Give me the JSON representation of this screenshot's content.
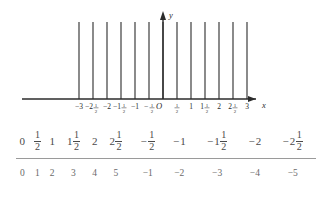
{
  "figure": {
    "name": "impulse-train-plot",
    "axis": {
      "x_label": "x",
      "y_label": "y",
      "origin_label": "O"
    },
    "x_ticks": [
      {
        "label": "-3",
        "value": -3.0
      },
      {
        "label": "-2",
        "value": -2.5,
        "mixed": true,
        "whole": "2",
        "sign": "-",
        "num": "1",
        "den": "2"
      },
      {
        "label": "-2",
        "value": -2.0
      },
      {
        "label": "-1",
        "value": -1.5,
        "mixed": true,
        "whole": "1",
        "sign": "-",
        "num": "1",
        "den": "2"
      },
      {
        "label": "-1",
        "value": -1.0
      },
      {
        "label": "-",
        "value": -0.5,
        "mixed": false,
        "sign": "-",
        "num": "1",
        "den": "2"
      },
      {
        "label": "",
        "value": 0.0
      },
      {
        "label": "",
        "value": 0.5,
        "mixed": false,
        "sign": "",
        "num": "1",
        "den": "2"
      },
      {
        "label": "1",
        "value": 1.0
      },
      {
        "label": "1",
        "value": 1.5,
        "mixed": true,
        "whole": "1",
        "sign": "",
        "num": "1",
        "den": "2"
      },
      {
        "label": "2",
        "value": 2.0
      },
      {
        "label": "2",
        "value": 2.5,
        "mixed": true,
        "whole": "2",
        "sign": "",
        "num": "1",
        "den": "2"
      },
      {
        "label": "3",
        "value": 3.0
      }
    ],
    "stems": {
      "count": 13,
      "positions": [
        -3.0,
        -2.5,
        -2.0,
        -1.5,
        -1.0,
        -0.5,
        0.0,
        0.5,
        1.0,
        1.5,
        2.0,
        2.5,
        3.0
      ],
      "height": 1.0
    },
    "colors": {
      "stroke": "#2b2b2b",
      "background": "#ffffff"
    }
  },
  "table": {
    "row_top": [
      {
        "sign": "",
        "whole": "0",
        "num": "",
        "den": ""
      },
      {
        "sign": "",
        "whole": "",
        "num": "1",
        "den": "2"
      },
      {
        "sign": "",
        "whole": "1",
        "num": "",
        "den": ""
      },
      {
        "sign": "",
        "whole": "1",
        "num": "1",
        "den": "2"
      },
      {
        "sign": "",
        "whole": "2",
        "num": "",
        "den": ""
      },
      {
        "sign": "",
        "whole": "2",
        "num": "1",
        "den": "2"
      },
      {
        "sign": "−",
        "whole": "",
        "num": "1",
        "den": "2"
      },
      {
        "sign": "−",
        "whole": "1",
        "num": "",
        "den": ""
      },
      {
        "sign": "−",
        "whole": "1",
        "num": "1",
        "den": "2"
      },
      {
        "sign": "−",
        "whole": "2",
        "num": "",
        "den": ""
      },
      {
        "sign": "−",
        "whole": "2",
        "num": "1",
        "den": "2"
      }
    ],
    "row_bottom": [
      "0",
      "1",
      "2",
      "3",
      "4",
      "5",
      "−1",
      "−2",
      "−3",
      "−4",
      "−5"
    ]
  }
}
